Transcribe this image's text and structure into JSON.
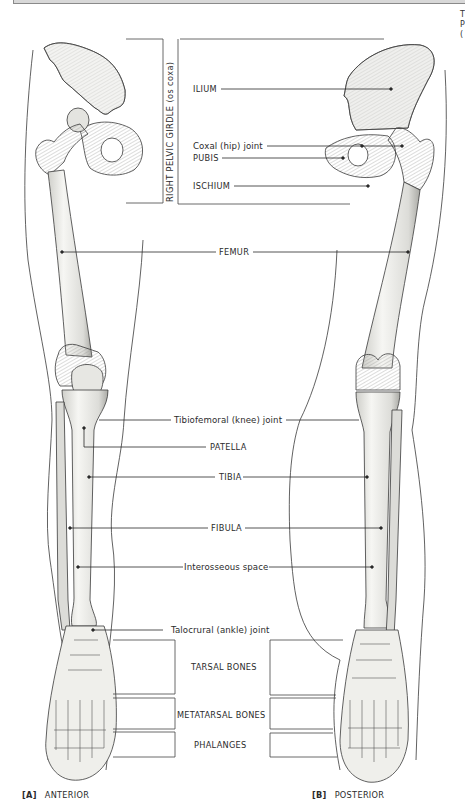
{
  "figure": {
    "corner_fragment": [
      "T",
      "P",
      "("
    ],
    "pelvic_bracket_label": "RIGHT PELVIC GIRDLE (os coxa)",
    "labels": {
      "ilium": "ILIUM",
      "coxal_joint": "Coxal (hip) joint",
      "pubis": "PUBIS",
      "ischium": "ISCHIUM",
      "femur": "FEMUR",
      "knee_joint": "Tibiofemoral (knee) joint",
      "patella": "PATELLA",
      "tibia": "TIBIA",
      "fibula": "FIBULA",
      "interosseous": "Interosseous space",
      "ankle_joint": "Talocrural (ankle) joint",
      "tarsal": "TARSAL BONES",
      "metatarsal": "METATARSAL BONES",
      "phalanges": "PHALANGES"
    },
    "captions": {
      "a_key": "[A]",
      "a_text": "ANTERIOR",
      "b_key": "[B]",
      "b_text": "POSTERIOR"
    },
    "colors": {
      "line": "#2a2a2a",
      "bone_fill": "#f1f1ee",
      "bone_shade": "#b9b9b4",
      "skin_outline": "#3a3a3a"
    }
  }
}
